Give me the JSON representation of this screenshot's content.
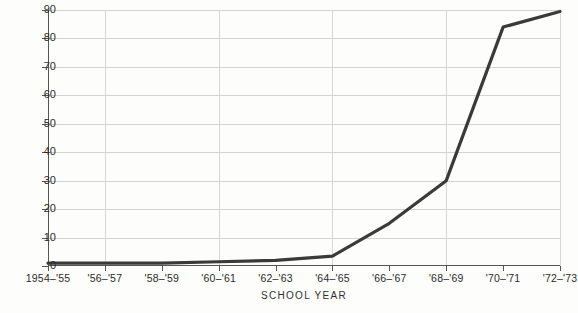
{
  "chart_data": {
    "type": "line",
    "title": "",
    "xlabel": "SCHOOL YEAR",
    "ylabel": "PERCENTAGE",
    "categories": [
      "1954–'55",
      "'56–'57",
      "'58–'59",
      "'60–'61",
      "'62–'63",
      "'64–'65",
      "'66–'67",
      "'68–'69",
      "'70–'71",
      "'72–'73"
    ],
    "values": [
      1,
      1,
      1,
      1.5,
      2,
      3.5,
      15,
      30,
      84,
      89.5
    ],
    "series": [
      {
        "name": "Percentage",
        "values": [
          1,
          1,
          1,
          1.5,
          2,
          3.5,
          15,
          30,
          84,
          89.5
        ]
      }
    ],
    "ylim": [
      0,
      90
    ],
    "yticks": [
      0,
      10,
      20,
      30,
      40,
      50,
      60,
      70,
      80,
      90
    ],
    "ytick_labels": [
      "0",
      "10",
      "20",
      "30",
      "40",
      "50",
      "60",
      "70",
      "80",
      "90"
    ],
    "grid": "horizontal-and-partial-vertical",
    "vertical_gridline_categories": [
      "'56–'57",
      "'60–'61",
      "'64–'65",
      "'68–'69",
      "'72–'73"
    ],
    "legend": "none",
    "line_color": "#3a3a3a",
    "grid_color": "#d2d2d2",
    "axis_color": "#555555",
    "background_color": "#fdfdfc"
  }
}
